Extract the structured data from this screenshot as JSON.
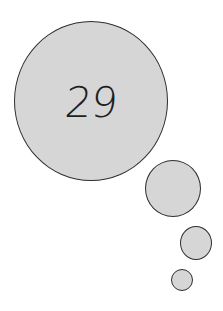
{
  "thought_bubble": {
    "number": "29",
    "fill_color": "#d6d6d6",
    "stroke_color": "#2e2e2e"
  }
}
